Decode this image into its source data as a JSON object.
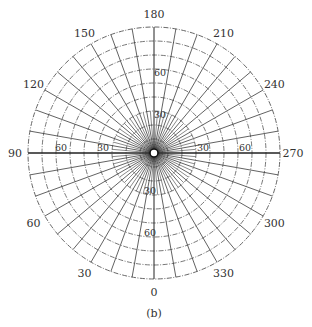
{
  "figure": {
    "caption": "(b)",
    "type": "polar-net",
    "center": [
      154,
      153
    ],
    "outer_radius": 126,
    "colors": {
      "line": "#3a3a3a",
      "ring": "#555555",
      "text": "#333333",
      "background": "#ffffff"
    }
  },
  "grid": {
    "ring_step_deg": 10,
    "ring_max_deg": 90,
    "spoke_step_deg": 10,
    "inner_spoke_step_deg": 5,
    "inner_spoke_extent_deg": 30,
    "inner_dense_rings": [
      2,
      4,
      6,
      8
    ],
    "center_marker_radius": 4
  },
  "azimuth_labels": [
    {
      "text": "180",
      "angle": 180
    },
    {
      "text": "210",
      "angle": 210
    },
    {
      "text": "240",
      "angle": 240
    },
    {
      "text": "270",
      "angle": 270
    },
    {
      "text": "300",
      "angle": 300
    },
    {
      "text": "330",
      "angle": 330
    },
    {
      "text": "0",
      "angle": 0
    },
    {
      "text": "30",
      "angle": 30
    },
    {
      "text": "60",
      "angle": 60
    },
    {
      "text": "90",
      "angle": 90
    },
    {
      "text": "120",
      "angle": 120
    },
    {
      "text": "150",
      "angle": 150
    }
  ],
  "radial_labels": [
    {
      "text": "60",
      "axis": "left",
      "value": 60
    },
    {
      "text": "30",
      "axis": "left",
      "value": 30
    },
    {
      "text": "30",
      "axis": "right",
      "value": 30
    },
    {
      "text": "60",
      "axis": "right",
      "value": 60
    },
    {
      "text": "60",
      "axis": "top",
      "value": 60
    },
    {
      "text": "30",
      "axis": "top",
      "value": 30
    },
    {
      "text": "30",
      "axis": "bottom",
      "value": 30
    },
    {
      "text": "60",
      "axis": "bottom",
      "value": 60
    }
  ]
}
